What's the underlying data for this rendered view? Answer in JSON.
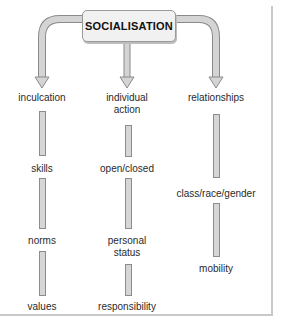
{
  "diagram": {
    "root": "SOCIALISATION",
    "branches": [
      {
        "heading": "inculcation",
        "items": [
          "skills",
          "norms",
          "values"
        ]
      },
      {
        "heading": "individual action",
        "heading_lines": [
          "individual",
          "action"
        ],
        "items": [
          "open/closed",
          "personal status",
          "responsibility"
        ],
        "item_lines": {
          "personal status": [
            "personal",
            "status"
          ]
        }
      },
      {
        "heading": "relationships",
        "items": [
          "class/race/gender",
          "mobility"
        ]
      }
    ]
  },
  "labels": {
    "b0_head": "inculcation",
    "b0_i0": "skills",
    "b0_i1": "norms",
    "b0_i2": "values",
    "b1_head_l1": "individual",
    "b1_head_l2": "action",
    "b1_i0": "open/closed",
    "b1_i1_l1": "personal",
    "b1_i1_l2": "status",
    "b1_i2": "responsibility",
    "b2_head": "relationships",
    "b2_i0": "class/race/gender",
    "b2_i1": "mobility"
  },
  "colors": {
    "arrow_fill": "#d4d4d4",
    "arrow_stroke": "#8a8a8a",
    "box_fill": "#f1f1f1",
    "frame": "#c9c9c9"
  }
}
